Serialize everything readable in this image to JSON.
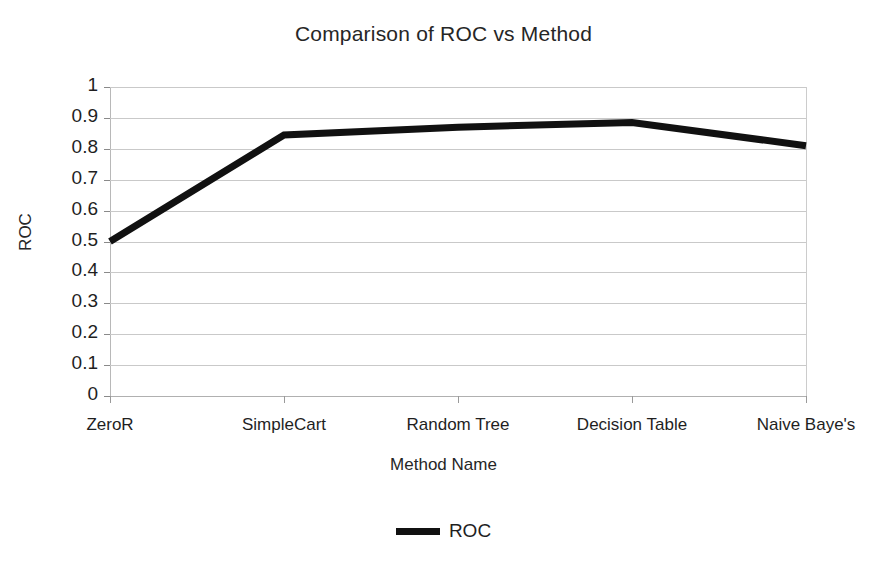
{
  "chart_data": {
    "type": "line",
    "title": "Comparison of ROC vs Method",
    "xlabel": "Method Name",
    "ylabel": "ROC",
    "categories": [
      "ZeroR",
      "SimpleCart",
      "Random Tree",
      "Decision Table",
      "Naive Baye's"
    ],
    "series": [
      {
        "name": "ROC",
        "color": "#111111",
        "values": [
          0.5,
          0.845,
          0.87,
          0.885,
          0.81
        ]
      }
    ],
    "ylim": [
      0,
      1
    ],
    "yticks": [
      "1",
      "0.9",
      "0.8",
      "0.7",
      "0.6",
      "0.5",
      "0.4",
      "0.3",
      "0.2",
      "0.1",
      "0"
    ],
    "ytick_values": [
      1,
      0.9,
      0.8,
      0.7,
      0.6,
      0.5,
      0.4,
      0.3,
      0.2,
      0.1,
      0
    ],
    "grid": "horizontal",
    "legend_position": "bottom-center",
    "legend_entries": [
      "ROC"
    ]
  },
  "legend": {
    "items": [
      {
        "label": "ROC",
        "marker": "thick-line-swatch"
      }
    ]
  }
}
